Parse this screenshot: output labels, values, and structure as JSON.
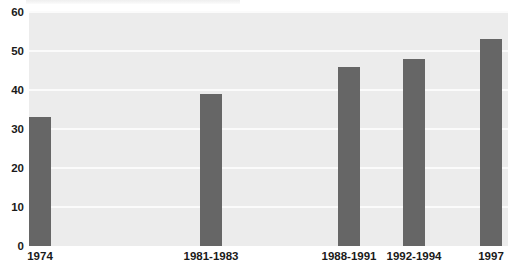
{
  "title_strip": {
    "ghost_text": "",
    "visible": true
  },
  "colors": {
    "bar": "#666666",
    "plot_background": "#ececec",
    "gridline": "#fbfbfb",
    "page_background": "#ffffff",
    "text": "#1a1a1a"
  },
  "chart_data": {
    "type": "bar",
    "title": "",
    "xlabel": "",
    "ylabel": "",
    "categories": [
      "1974",
      "1981-1983",
      "1988-1991",
      "1992-1994",
      "1997"
    ],
    "values": [
      33,
      39,
      46,
      48,
      53
    ],
    "ylim": [
      0,
      60
    ],
    "ytick_step": 10,
    "yticks": [
      "0",
      "10",
      "20",
      "30",
      "40",
      "50",
      "60"
    ],
    "ytick_values": [
      0,
      10,
      20,
      30,
      40,
      50,
      60
    ],
    "grid": true,
    "grid_axis": "y",
    "legend": false,
    "legend_position": "none",
    "bar_color": "#666666",
    "bar_width_px": 22,
    "bar_centers_px": [
      40,
      211,
      349,
      414,
      491
    ]
  }
}
